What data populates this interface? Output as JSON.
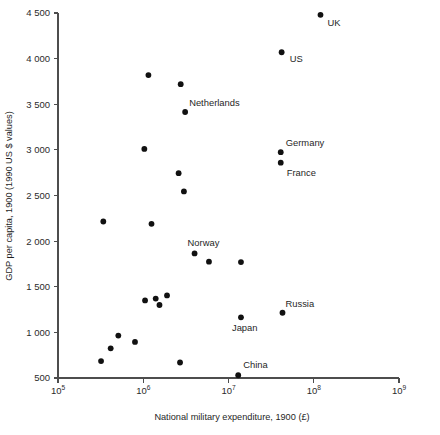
{
  "chart_data": {
    "type": "scatter",
    "title": "",
    "xlabel": "National military expenditure, 1900 (£)",
    "ylabel": "GDP per capita, 1900 (1990 US $ values)",
    "x_scale": "log",
    "y_scale": "linear",
    "xlim": [
      100000,
      1000000000
    ],
    "ylim": [
      500,
      4500
    ],
    "grid": false,
    "legend": false,
    "x_ticks": [
      {
        "value": 100000,
        "label": "10",
        "exponent": "5"
      },
      {
        "value": 1000000,
        "label": "10",
        "exponent": "6"
      },
      {
        "value": 10000000,
        "label": "10",
        "exponent": "7"
      },
      {
        "value": 100000000,
        "label": "10",
        "exponent": "8"
      },
      {
        "value": 1000000000,
        "label": "10",
        "exponent": "9"
      }
    ],
    "y_ticks": [
      {
        "value": 4500,
        "label": "4 500"
      },
      {
        "value": 4000,
        "label": "4 000"
      },
      {
        "value": 3500,
        "label": "3 500"
      },
      {
        "value": 3000,
        "label": "3 000"
      },
      {
        "value": 2500,
        "label": "2 500"
      },
      {
        "value": 2000,
        "label": "2 000"
      },
      {
        "value": 1500,
        "label": "1 500"
      },
      {
        "value": 1000,
        "label": "1 000"
      },
      {
        "value": 500,
        "label": "500"
      }
    ],
    "point_color": "#111111",
    "axis_color": "#4d4d4d",
    "points": [
      {
        "label": "UK",
        "x": 120000000,
        "y": 4480,
        "label_dx": 7,
        "label_dy": 11,
        "anchor": "start"
      },
      {
        "label": "US",
        "x": 42000000,
        "y": 4070,
        "label_dx": 8,
        "label_dy": 10,
        "anchor": "start"
      },
      {
        "label": "",
        "x": 1150000,
        "y": 3820,
        "label_dx": 0,
        "label_dy": 0,
        "anchor": "start"
      },
      {
        "label": "",
        "x": 2750000,
        "y": 3720,
        "label_dx": 0,
        "label_dy": 0,
        "anchor": "start"
      },
      {
        "label": "Netherlands",
        "x": 3100000,
        "y": 3415,
        "label_dx": 4,
        "label_dy": -6,
        "anchor": "start"
      },
      {
        "label": "",
        "x": 1030000,
        "y": 3010,
        "label_dx": 0,
        "label_dy": 0,
        "anchor": "start"
      },
      {
        "label": "Germany",
        "x": 41000000,
        "y": 2975,
        "label_dx": 5,
        "label_dy": -6,
        "anchor": "start"
      },
      {
        "label": "France",
        "x": 41000000,
        "y": 2860,
        "label_dx": 6,
        "label_dy": 13,
        "anchor": "start"
      },
      {
        "label": "",
        "x": 2600000,
        "y": 2745,
        "label_dx": 0,
        "label_dy": 0,
        "anchor": "start"
      },
      {
        "label": "",
        "x": 3000000,
        "y": 2545,
        "label_dx": 0,
        "label_dy": 0,
        "anchor": "start"
      },
      {
        "label": "",
        "x": 340000,
        "y": 2215,
        "label_dx": 0,
        "label_dy": 0,
        "anchor": "start"
      },
      {
        "label": "",
        "x": 1250000,
        "y": 2190,
        "label_dx": 0,
        "label_dy": 0,
        "anchor": "start"
      },
      {
        "label": "Norway",
        "x": 4000000,
        "y": 1865,
        "label_dx": -7,
        "label_dy": -7,
        "anchor": "start"
      },
      {
        "label": "",
        "x": 5900000,
        "y": 1775,
        "label_dx": 0,
        "label_dy": 0,
        "anchor": "start"
      },
      {
        "label": "",
        "x": 14000000,
        "y": 1770,
        "label_dx": 0,
        "label_dy": 0,
        "anchor": "start"
      },
      {
        "label": "",
        "x": 1900000,
        "y": 1405,
        "label_dx": 0,
        "label_dy": 0,
        "anchor": "start"
      },
      {
        "label": "",
        "x": 1400000,
        "y": 1370,
        "label_dx": 0,
        "label_dy": 0,
        "anchor": "start"
      },
      {
        "label": "",
        "x": 1050000,
        "y": 1350,
        "label_dx": 0,
        "label_dy": 0,
        "anchor": "start"
      },
      {
        "label": "",
        "x": 1550000,
        "y": 1300,
        "label_dx": 0,
        "label_dy": 0,
        "anchor": "start"
      },
      {
        "label": "Russia",
        "x": 43000000,
        "y": 1215,
        "label_dx": 3,
        "label_dy": -6,
        "anchor": "start"
      },
      {
        "label": "Japan",
        "x": 14000000,
        "y": 1165,
        "label_dx": -9,
        "label_dy": 14,
        "anchor": "start"
      },
      {
        "label": "",
        "x": 510000,
        "y": 965,
        "label_dx": 0,
        "label_dy": 0,
        "anchor": "start"
      },
      {
        "label": "",
        "x": 800000,
        "y": 895,
        "label_dx": 0,
        "label_dy": 0,
        "anchor": "start"
      },
      {
        "label": "",
        "x": 415000,
        "y": 825,
        "label_dx": 0,
        "label_dy": 0,
        "anchor": "start"
      },
      {
        "label": "",
        "x": 320000,
        "y": 685,
        "label_dx": 0,
        "label_dy": 0,
        "anchor": "start"
      },
      {
        "label": "",
        "x": 2700000,
        "y": 670,
        "label_dx": 0,
        "label_dy": 0,
        "anchor": "start"
      },
      {
        "label": "China",
        "x": 13000000,
        "y": 530,
        "label_dx": 5,
        "label_dy": -7,
        "anchor": "start"
      }
    ]
  }
}
